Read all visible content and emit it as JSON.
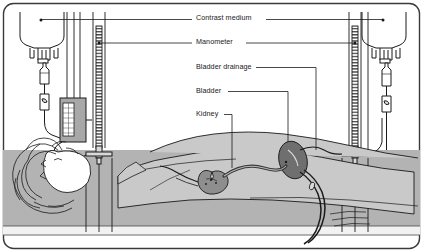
{
  "figure": {
    "frame_color": "#3a3a3a",
    "ink_color": "#1a1a1a",
    "bed_color": "#b3b3b3",
    "body_color": "#c9c9c9",
    "organ_color": "#8e8e8e",
    "organ_dark_color": "#6f6f6f",
    "device_color": "#a8a8a8"
  },
  "labels": [
    {
      "id": "contrast-medium",
      "text": "Contrast medium",
      "x": 196,
      "y": 14
    },
    {
      "id": "manometer",
      "text": "Manometer",
      "x": 196,
      "y": 39
    },
    {
      "id": "bladder-drainage",
      "text": "Bladder drainage",
      "x": 196,
      "y": 64
    },
    {
      "id": "bladder",
      "text": "Bladder",
      "x": 196,
      "y": 88
    },
    {
      "id": "kidney",
      "text": "Kidney",
      "x": 196,
      "y": 111
    }
  ],
  "components": {
    "iv_bag_left": "inverted-iv-bag-left",
    "iv_bag_right": "inverted-iv-bag-right",
    "drip_chamber_left": "drip-chamber-left",
    "drip_chamber_right": "drip-chamber-right",
    "roller_clamp_left": "roller-clamp-left",
    "roller_clamp_right": "roller-clamp-right",
    "manometer_column_left": "graduated-manometer-column-left",
    "manometer_column_right": "graduated-manometer-column-right",
    "stopcock_left": "three-way-stopcock-left",
    "stopcock_right": "three-way-stopcock-right",
    "pump_box": "infusion-pump-box",
    "patient": "supine-patient-figure",
    "kidney": "kidney-organ",
    "bladder": "bladder-organ",
    "ureter": "ureter-tube",
    "catheter": "bladder-drainage-catheter",
    "bed": "examination-table"
  }
}
